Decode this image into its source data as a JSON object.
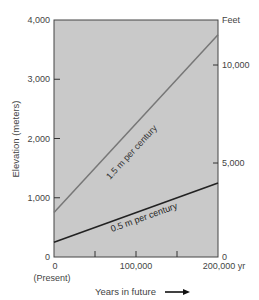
{
  "chart_data": {
    "type": "line",
    "title": "",
    "xlabel": "Years in future",
    "ylabel": "Elevation (meters)",
    "ylabel_right": "Feet",
    "xlim": [
      0,
      200000
    ],
    "ylim": [
      0,
      4000
    ],
    "x_ticks": [
      0,
      100000,
      200000
    ],
    "x_tick_labels": [
      "0",
      "100,000",
      "200,000 yr"
    ],
    "x_minor_ticks": [
      50000,
      100000,
      150000
    ],
    "x_sub_label": "(Present)",
    "y_ticks": [
      0,
      1000,
      2000,
      3000,
      4000
    ],
    "y_tick_labels": [
      "0",
      "1,000",
      "2,000",
      "3,000",
      "4,000"
    ],
    "y_right_ticks_feet": [
      0,
      5000,
      10000
    ],
    "y_right_tick_labels": [
      "0",
      "5,000",
      "10,000"
    ],
    "grid": false,
    "background": "#c8c8c8",
    "series": [
      {
        "name": "1.5 m per century",
        "x": [
          0,
          200000
        ],
        "values": [
          750,
          3750
        ],
        "color": "#777777"
      },
      {
        "name": "0.5 m per century",
        "x": [
          0,
          200000
        ],
        "values": [
          250,
          1250
        ],
        "color": "#222222"
      }
    ],
    "annotations": [
      "1.5 m per century",
      "0.5 m per century",
      "Years in future →"
    ]
  }
}
